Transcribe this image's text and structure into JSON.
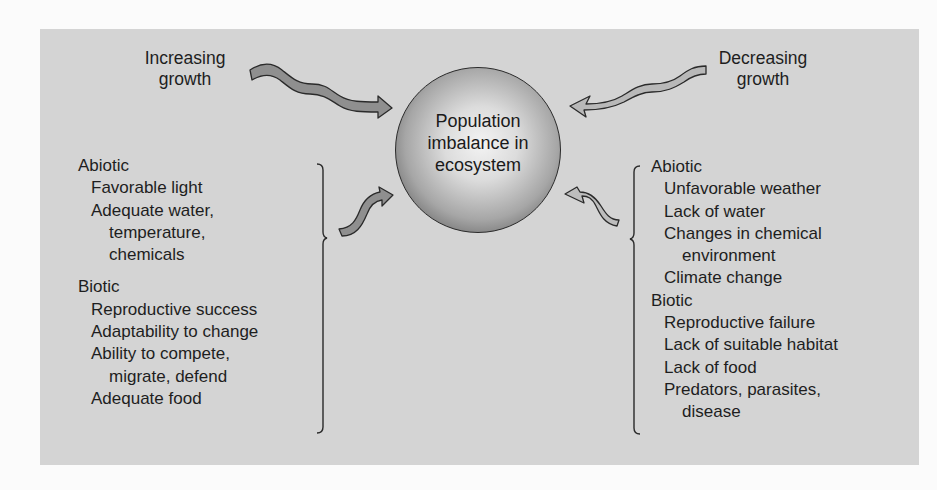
{
  "diagram": {
    "center": {
      "lines": [
        "Population",
        "imbalance in",
        "ecosystem"
      ]
    },
    "left": {
      "title_lines": [
        "Increasing",
        "growth"
      ],
      "abiotic": {
        "heading": "Abiotic",
        "items": [
          "Favorable light",
          "Adequate water,",
          "temperature,",
          "chemicals"
        ]
      },
      "biotic": {
        "heading": "Biotic",
        "items": [
          "Reproductive success",
          "Adaptability to change",
          "Ability to compete,",
          "migrate, defend",
          "Adequate food"
        ]
      }
    },
    "right": {
      "title_lines": [
        "Decreasing",
        "growth"
      ],
      "abiotic": {
        "heading": "Abiotic",
        "items": [
          "Unfavorable weather",
          "Lack of water",
          "Changes in chemical",
          "environment",
          "Climate change"
        ]
      },
      "biotic": {
        "heading": "Biotic",
        "items": [
          "Reproductive failure",
          "Lack of suitable habitat",
          "Lack of food",
          "Predators, parasites,",
          "disease"
        ]
      }
    },
    "colors": {
      "panel": "#d4d4d4",
      "arrow_dark": "#8f8f8f",
      "arrow_light": "#bdbdbd",
      "outline": "#2a2a2a"
    }
  }
}
